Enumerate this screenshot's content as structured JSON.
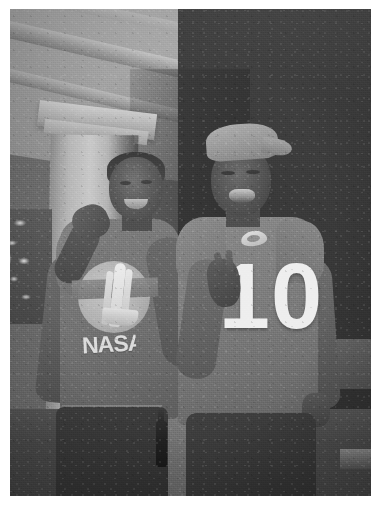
{
  "photo": {
    "medium": "scanned photographic print",
    "color_mode": "grayscale",
    "quality": "low-resolution, grainy, soft focus, night flash photograph",
    "border": {
      "style": "white print border",
      "color": "#ffffff",
      "left_px": 10,
      "top_px": 9,
      "right_px": 8,
      "bottom_px": 14
    },
    "print_area": {
      "x": 10,
      "y": 9,
      "width": 361,
      "height": 487
    },
    "scene": {
      "setting": "covered front porch at night",
      "lighting": "direct camera flash, dark background",
      "subjects_count": 2
    },
    "background": {
      "elements": [
        {
          "name": "porch-ceiling",
          "description": "bright painted ceiling with angled beams, upper left"
        },
        {
          "name": "ceiling-beam",
          "description": "diagonal trim beams running upper-left to center"
        },
        {
          "name": "porch-column",
          "description": "white square column with capital, left of center"
        },
        {
          "name": "dark-doorway",
          "description": "deep shadow / night area filling the right side"
        },
        {
          "name": "foliage",
          "description": "flash-lit leaves at far left edge"
        },
        {
          "name": "porch-deck",
          "description": "dark floorboards across the bottom"
        },
        {
          "name": "porch-railing",
          "description": "faint rail shape at right"
        }
      ],
      "tones": {
        "ceiling_highlight": "#b9b9b6",
        "column_highlight": "#cbcbc8",
        "shadow_dark": "#2e2e2d",
        "midtone": "#6d6d6d"
      }
    },
    "subjects": [
      {
        "id": "person-left",
        "position": "left",
        "pose": "standing, arm raised with hand near face, smiling",
        "skin_tone": "#5e5b57",
        "clothing": {
          "top": {
            "type": "t-shirt",
            "tone": "#76766f",
            "graphic": {
              "name": "nasa-shuttle-emblem",
              "shape": "circular patch",
              "contents": "space shuttle with twin booster rockets over a horizontal band",
              "wordmark": "NASA",
              "graphic_color": "#e9e9e5"
            }
          },
          "bottom": {
            "type": "dark pants",
            "tone": "#343432"
          }
        }
      },
      {
        "id": "person-right",
        "position": "right",
        "pose": "standing, one hand raised making a two-finger gesture, head tilted back, mouth open",
        "skin_tone": "#57544f",
        "clothing": {
          "headwear": {
            "type": "baseball cap",
            "tone": "#9a9a95"
          },
          "top": {
            "type": "football jersey t-shirt",
            "tone": "#7f7f79",
            "number": "10",
            "number_color": "#f2f2ef",
            "logo": {
              "name": "arrowhead-team-logo",
              "description": "small light-colored team crest above the number",
              "color": "#efefeb"
            }
          },
          "bottom": {
            "type": "dark shorts",
            "tone": "#353533"
          }
        }
      }
    ],
    "props": [
      {
        "name": "bottle",
        "description": "dark glass bottle standing on the deck between the two subjects",
        "tone": "#1f1f1e"
      }
    ]
  }
}
